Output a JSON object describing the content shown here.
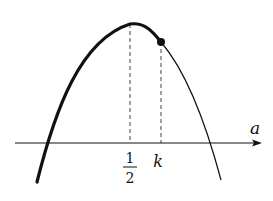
{
  "diagram": {
    "type": "downward-parabola",
    "axis": {
      "label": "a"
    },
    "marks": [
      {
        "id": "vertex",
        "label_num": "1",
        "label_den": "2"
      },
      {
        "id": "k",
        "label": "k"
      }
    ],
    "point": "filled dot on curve at a = k",
    "colors": {
      "stroke": "#111111",
      "background": "#ffffff"
    }
  }
}
